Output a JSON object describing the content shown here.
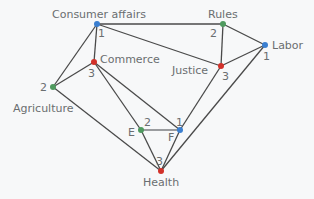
{
  "diagram": {
    "type": "graph-coloring",
    "colors": {
      "1": "#3b7fd0",
      "2": "#4f9a5f",
      "3": "#d2312a"
    },
    "nodes": [
      {
        "id": "consumer",
        "label": "Consumer affairs",
        "color_number": "1",
        "x": 97,
        "y": 24
      },
      {
        "id": "rules",
        "label": "Rules",
        "color_number": "2",
        "x": 223,
        "y": 24
      },
      {
        "id": "labor",
        "label": "Labor",
        "color_number": "1",
        "x": 265,
        "y": 45
      },
      {
        "id": "commerce",
        "label": "Commerce",
        "color_number": "3",
        "x": 94,
        "y": 62
      },
      {
        "id": "justice",
        "label": "Justice",
        "color_number": "3",
        "x": 221,
        "y": 66
      },
      {
        "id": "agriculture",
        "label": "Agriculture",
        "color_number": "2",
        "x": 53,
        "y": 87
      },
      {
        "id": "e",
        "label": "E",
        "color_number": "2",
        "x": 141,
        "y": 130
      },
      {
        "id": "f",
        "label": "F",
        "color_number": "1",
        "x": 180,
        "y": 130
      },
      {
        "id": "health",
        "label": "Health",
        "color_number": "3",
        "x": 161,
        "y": 171
      }
    ],
    "edges": [
      [
        "consumer",
        "rules"
      ],
      [
        "consumer",
        "justice"
      ],
      [
        "consumer",
        "commerce"
      ],
      [
        "consumer",
        "agriculture"
      ],
      [
        "rules",
        "justice"
      ],
      [
        "rules",
        "labor"
      ],
      [
        "justice",
        "labor"
      ],
      [
        "commerce",
        "agriculture"
      ],
      [
        "commerce",
        "e"
      ],
      [
        "commerce",
        "f"
      ],
      [
        "agriculture",
        "health"
      ],
      [
        "e",
        "f"
      ],
      [
        "e",
        "health"
      ],
      [
        "f",
        "health"
      ],
      [
        "justice",
        "f"
      ],
      [
        "labor",
        "health"
      ]
    ]
  },
  "labels": {
    "consumer": "Consumer affairs",
    "rules": "Rules",
    "labor": "Labor",
    "commerce": "Commerce",
    "justice": "Justice",
    "agriculture": "Agriculture",
    "e": "E",
    "f": "F",
    "health": "Health"
  },
  "numbers": {
    "consumer": "1",
    "rules": "2",
    "labor": "1",
    "commerce": "3",
    "justice": "3",
    "agriculture": "2",
    "e": "2",
    "f": "1",
    "health": "3"
  }
}
